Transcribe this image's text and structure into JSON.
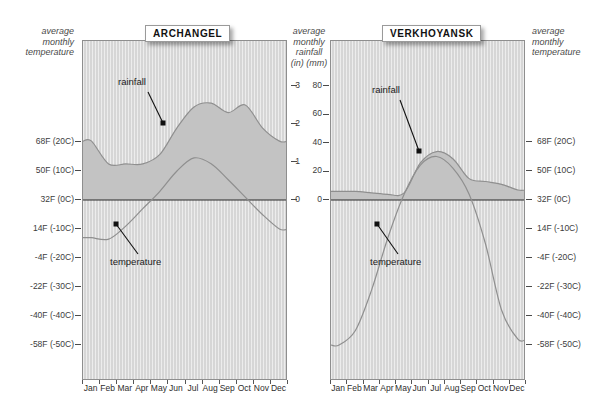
{
  "figure": {
    "left_axis_title": "average\nmonthly\ntemperature",
    "center_axis_title": "average\nmonthly\nrainfall\n(in) (mm)",
    "right_axis_title": "average\nmonthly\ntemperature"
  },
  "axes": {
    "temperature_ticks": [
      {
        "label": "68F (20C)",
        "c": 20
      },
      {
        "label": "50F (10C)",
        "c": 10
      },
      {
        "label": "32F (0C)",
        "c": 0
      },
      {
        "label": "14F (-10C)",
        "c": -10
      },
      {
        "label": "-4F (-20C)",
        "c": -20
      },
      {
        "label": "-22F (-30C)",
        "c": -30
      },
      {
        "label": "-40F (-40C)",
        "c": -40
      },
      {
        "label": "-58F (-50C)",
        "c": -50
      }
    ],
    "rainfall_inch_ticks": [
      {
        "label": "3",
        "v": 3
      },
      {
        "label": "2",
        "v": 2
      },
      {
        "label": "1",
        "v": 1
      },
      {
        "label": "0",
        "v": 0
      }
    ],
    "rainfall_mm_ticks": [
      {
        "label": "80",
        "v": 80
      },
      {
        "label": "60",
        "v": 60
      },
      {
        "label": "40",
        "v": 40
      },
      {
        "label": "20",
        "v": 20
      },
      {
        "label": "0",
        "v": 0
      }
    ],
    "months": [
      "Jan",
      "Feb",
      "Mar",
      "Apr",
      "May",
      "Jun",
      "Jul",
      "Aug",
      "Sep",
      "Oct",
      "Nov",
      "Dec"
    ]
  },
  "panels": [
    {
      "id": "archangel",
      "title": "ARCHANGEL",
      "rainfall_label": "rainfall",
      "temperature_label": "temperature"
    },
    {
      "id": "verkhoyansk",
      "title": "VERKHOYANSK",
      "rainfall_label": "rainfall",
      "temperature_label": "temperature"
    }
  ],
  "colors": {
    "panel_bg": "#d6d6d6",
    "rain_fill": "#c3c3c3",
    "curve": "#8a8a8a",
    "zero_line": "#2b2b2b",
    "border": "#8e8e8e",
    "text": "#2d2d2d"
  },
  "chart_data": [
    {
      "type": "area",
      "title": "ARCHANGEL",
      "xlabel": "",
      "ylabel": "average monthly rainfall (in)",
      "categories": [
        "Jan",
        "Feb",
        "Mar",
        "Apr",
        "May",
        "Jun",
        "Jul",
        "Aug",
        "Sep",
        "Oct",
        "Nov",
        "Dec"
      ],
      "grid": false,
      "legend": "annotations",
      "ylim": [
        0,
        3
      ],
      "series": [
        {
          "name": "rainfall",
          "unit": "in",
          "axis": "center-inches",
          "values": [
            1.55,
            0.95,
            0.95,
            0.95,
            1.2,
            1.9,
            2.45,
            2.55,
            2.3,
            2.5,
            1.9,
            1.55
          ]
        },
        {
          "name": "temperature",
          "unit": "C",
          "axis": "left-temperature",
          "values": [
            -13,
            -13.5,
            -9,
            -3,
            3,
            10,
            14.5,
            12.5,
            7,
            1,
            -5,
            -10
          ]
        }
      ]
    },
    {
      "type": "area",
      "title": "VERKHOYANSK",
      "xlabel": "",
      "ylabel": "average monthly rainfall (mm)",
      "categories": [
        "Jan",
        "Feb",
        "Mar",
        "Apr",
        "May",
        "Jun",
        "Jul",
        "Aug",
        "Sep",
        "Oct",
        "Nov",
        "Dec"
      ],
      "grid": false,
      "legend": "annotations",
      "ylim": [
        0,
        80
      ],
      "series": [
        {
          "name": "rainfall",
          "unit": "mm",
          "axis": "center-mm",
          "values": [
            6,
            6,
            5,
            4,
            5,
            26,
            34,
            29,
            15,
            13,
            11,
            7
          ]
        },
        {
          "name": "temperature",
          "unit": "C",
          "axis": "right-temperature",
          "values": [
            -50,
            -45,
            -31,
            -13,
            2,
            12,
            15,
            11,
            2,
            -15,
            -38,
            -48
          ]
        }
      ]
    }
  ]
}
